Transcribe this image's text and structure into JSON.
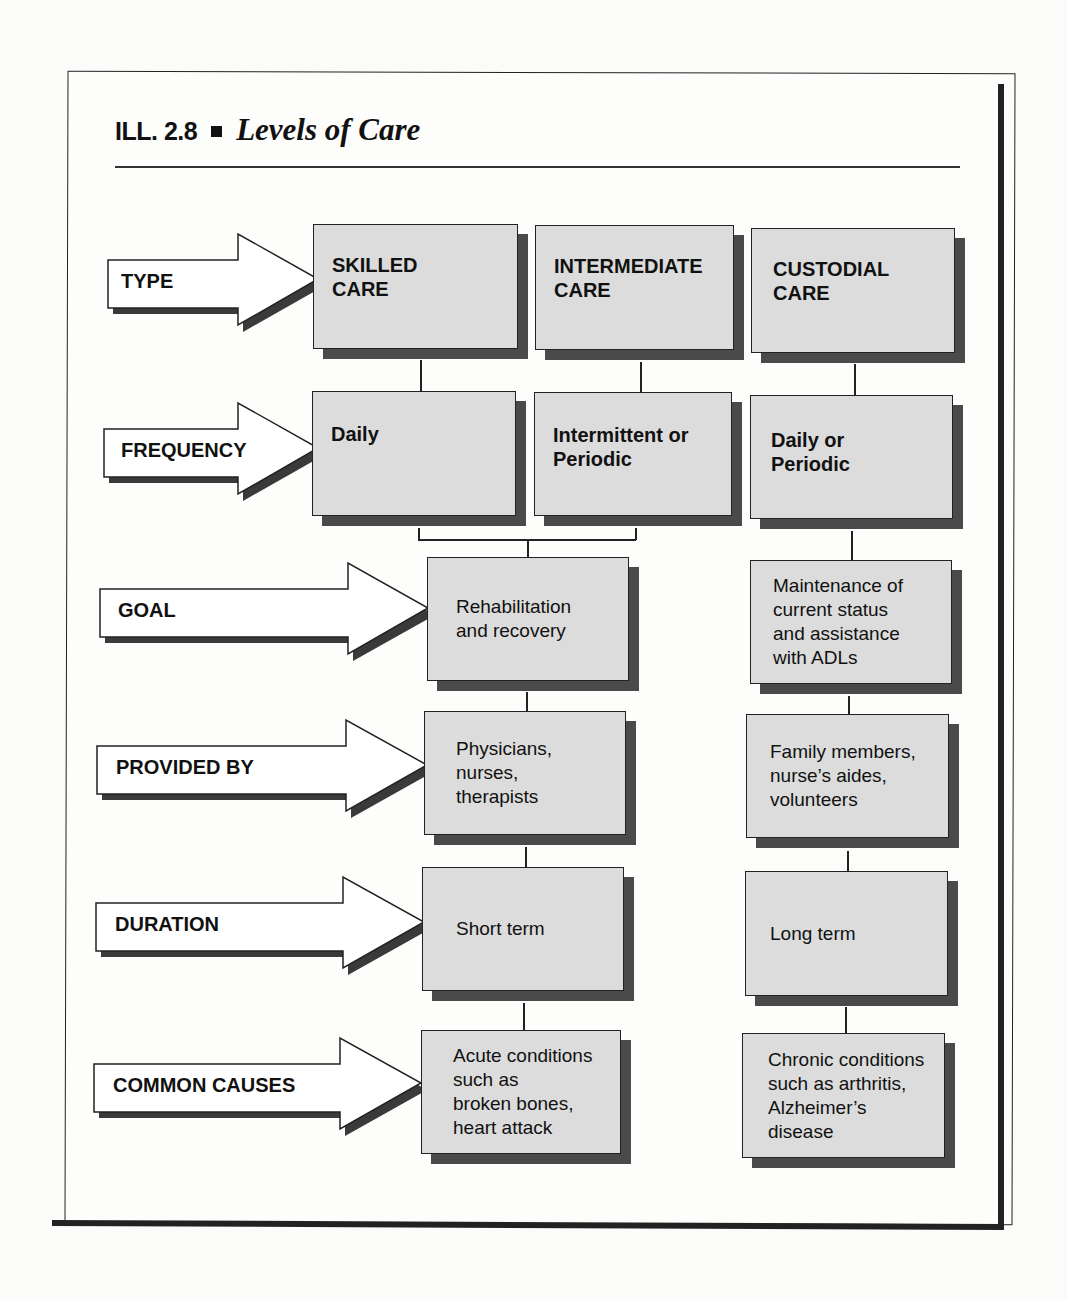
{
  "figure": {
    "number": "ILL. 2.8",
    "title": "Levels of Care"
  },
  "rows": [
    {
      "label": "TYPE"
    },
    {
      "label": "FREQUENCY"
    },
    {
      "label": "GOAL"
    },
    {
      "label": "PROVIDED BY"
    },
    {
      "label": "DURATION"
    },
    {
      "label": "COMMON CAUSES"
    }
  ],
  "type_row": {
    "skilled": [
      "SKILLED",
      "CARE"
    ],
    "intermediate": [
      "INTERMEDIATE",
      "CARE"
    ],
    "custodial": [
      "CUSTODIAL",
      "CARE"
    ]
  },
  "frequency_row": {
    "skilled": [
      "Daily"
    ],
    "intermediate": [
      "Intermittent or",
      "Periodic"
    ],
    "custodial": [
      "Daily or",
      "Periodic"
    ]
  },
  "skilled_intermediate": {
    "goal": [
      "Rehabilitation",
      "and recovery"
    ],
    "provided_by": [
      "Physicians,",
      "nurses,",
      "therapists"
    ],
    "duration": [
      "Short term"
    ],
    "common_causes": [
      "Acute conditions",
      "such as",
      "broken bones,",
      "heart attack"
    ]
  },
  "custodial": {
    "goal": [
      "Maintenance of",
      "current status",
      "and assistance",
      "with ADLs"
    ],
    "provided_by": [
      "Family members,",
      "nurse’s aides,",
      "volunteers"
    ],
    "duration": [
      "Long term"
    ],
    "common_causes": [
      "Chronic conditions",
      "such as arthritis,",
      "Alzheimer’s",
      "disease"
    ]
  },
  "colors": {
    "box_fill": "#dcdcdc",
    "box_shadow": "#4a4a4a",
    "stroke": "#222222"
  }
}
